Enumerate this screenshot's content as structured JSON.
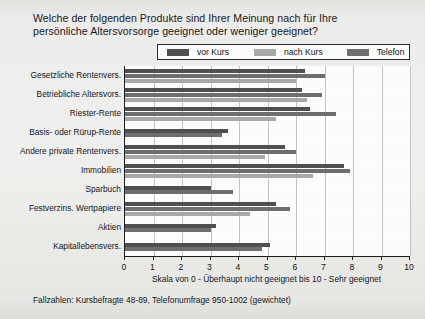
{
  "title": {
    "line1": "Welche der folgenden Produkte sind Ihrer Meinung nach für Ihre",
    "line2": "persönliche Altersvorsorge geeignet oder weniger geeignet?"
  },
  "footnote": "Fallzahlen: Kursbefragte 48-89, Telefonumfrage 950-1002 (gewichtet)",
  "colors": {
    "vor_kurs": "#4f4f4f",
    "telefon": "#6e6e6e",
    "nach_kurs": "#a9a9a9",
    "axis": "#1d1d1d",
    "grid": "#c3c3c3",
    "plot_background": "#fefefe",
    "page_background": "#eeeeec"
  },
  "chart_data": {
    "type": "bar",
    "orientation": "horizontal",
    "title": "Welche der folgenden Produkte sind Ihrer Meinung nach für Ihre persönliche Altersvorsorge geeignet oder weniger geeignet?",
    "xlabel": "Skala von 0 - Überhaupt nicht geeignet bis 10 - Sehr geeignet",
    "ylabel": "",
    "xlim": [
      0,
      10
    ],
    "xticks": [
      0,
      1,
      2,
      3,
      4,
      5,
      6,
      7,
      8,
      9,
      10
    ],
    "xticklabels": [
      "0",
      "1",
      "2",
      "3",
      "4",
      "5",
      "6",
      "7",
      "8",
      "9",
      "10"
    ],
    "grid": true,
    "legend_position": "top",
    "categories": [
      "Gesetzliche Rentenvers.",
      "Betriebliche Altersvors.",
      "Riester-Rente",
      "Basis- oder Rürup-Rente",
      "Andere private Rentenvers.",
      "Immobilien",
      "Sparbuch",
      "Festverzins. Wertpapiere",
      "Aktien",
      "Kapitallebensvers."
    ],
    "series": [
      {
        "name": "vor Kurs",
        "color": "#4f4f4f",
        "values": [
          6.3,
          6.2,
          6.5,
          3.6,
          5.6,
          7.7,
          3.0,
          5.3,
          3.2,
          5.1
        ]
      },
      {
        "name": "Telefon",
        "color": "#6e6e6e",
        "values": [
          7.0,
          6.9,
          7.4,
          3.4,
          6.0,
          7.9,
          3.8,
          5.8,
          3.0,
          4.8
        ]
      },
      {
        "name": "nach Kurs",
        "color": "#a9a9a9",
        "values": [
          6.0,
          6.4,
          5.3,
          null,
          4.9,
          6.6,
          null,
          4.4,
          null,
          null
        ]
      }
    ]
  }
}
